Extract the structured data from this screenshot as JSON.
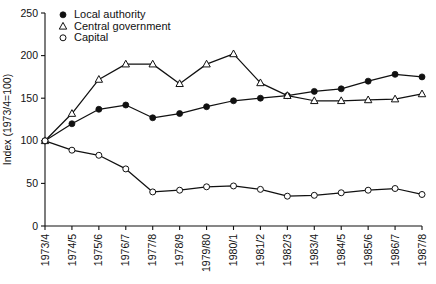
{
  "chart_data": {
    "type": "line",
    "title": "",
    "xlabel": "",
    "ylabel": "Index (1973/4=100)",
    "ylim": [
      0,
      250
    ],
    "yticks": [
      0,
      50,
      100,
      150,
      200,
      250
    ],
    "grid": false,
    "legend_position": "top-left",
    "categories": [
      "1973/4",
      "1974/5",
      "1975/6",
      "1976/7",
      "1977/8",
      "1978/9",
      "1979/80",
      "1980/1",
      "1981/2",
      "1982/3",
      "1983/4",
      "1984/5",
      "1985/6",
      "1986/7",
      "1987/8"
    ],
    "series": [
      {
        "name": "Local authority",
        "marker": "filled-circle",
        "values": [
          100,
          120,
          137,
          142,
          127,
          132,
          140,
          147,
          150,
          153,
          158,
          161,
          170,
          178,
          175
        ]
      },
      {
        "name": "Central government",
        "marker": "open-triangle",
        "values": [
          100,
          132,
          172,
          190,
          190,
          167,
          190,
          202,
          168,
          153,
          147,
          147,
          148,
          149,
          155
        ]
      },
      {
        "name": "Capital",
        "marker": "open-circle",
        "values": [
          100,
          89,
          83,
          67,
          40,
          42,
          46,
          47,
          43,
          35,
          36,
          39,
          42,
          44,
          37
        ]
      }
    ]
  },
  "legend": {
    "items": [
      {
        "label": "Local authority",
        "marker": "filled-circle"
      },
      {
        "label": "Central government",
        "marker": "open-triangle"
      },
      {
        "label": "Capital",
        "marker": "open-circle"
      }
    ]
  },
  "axes": {
    "y_title": "Index (1973/4=100)",
    "y_tick_labels": [
      "250",
      "200",
      "150",
      "100",
      "50",
      "0"
    ],
    "x_tick_labels": [
      "1973/4",
      "1974/5",
      "1975/6",
      "1976/7",
      "1977/8",
      "1978/9",
      "1979/80",
      "1980/1",
      "1981/2",
      "1982/3",
      "1983/4",
      "1984/5",
      "1985/6",
      "1986/7",
      "1987/8"
    ]
  },
  "colors": {
    "ink": "#111111",
    "background": "#ffffff"
  }
}
